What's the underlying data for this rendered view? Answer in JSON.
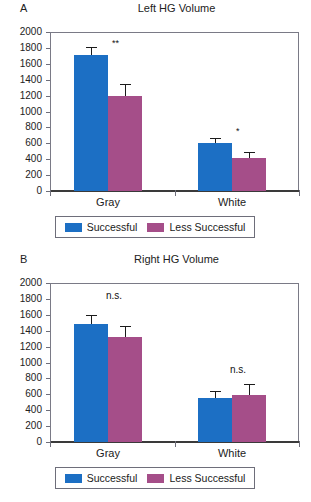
{
  "figure": {
    "panels": [
      {
        "letter": "A",
        "title": "Left HG Volume",
        "categories": [
          "Gray",
          "White"
        ],
        "legend": [
          {
            "label": "Successful",
            "color": "#1c6fc4"
          },
          {
            "label": "Less Successful",
            "color": "#a54e89"
          }
        ],
        "yticks": [
          "2000",
          "1800",
          "1600",
          "1400",
          "1200",
          "1000",
          "800",
          "600",
          "400",
          "200",
          "0"
        ],
        "annotations": [
          "**",
          "*"
        ]
      },
      {
        "letter": "B",
        "title": "Right HG Volume",
        "categories": [
          "Gray",
          "White"
        ],
        "legend": [
          {
            "label": "Successful",
            "color": "#1c6fc4"
          },
          {
            "label": "Less Successful",
            "color": "#a54e89"
          }
        ],
        "yticks": [
          "2000",
          "1800",
          "1600",
          "1400",
          "1200",
          "1000",
          "800",
          "600",
          "400",
          "200",
          "0"
        ],
        "annotations": [
          "n.s.",
          "n.s."
        ]
      }
    ]
  },
  "chart_data": [
    {
      "type": "bar",
      "panel": "A",
      "title": "Left HG Volume",
      "xlabel": "",
      "ylabel": "",
      "ylim": [
        0,
        2000
      ],
      "ytick_values": [
        0,
        200,
        400,
        600,
        800,
        1000,
        1200,
        1400,
        1600,
        1800,
        2000
      ],
      "grid": false,
      "legend_position": "below",
      "categories": [
        "Gray",
        "White"
      ],
      "series": [
        {
          "name": "Successful",
          "color": "#1c6fc4",
          "values": [
            1710,
            605
          ],
          "errors": [
            90,
            50
          ]
        },
        {
          "name": "Less Successful",
          "color": "#a54e89",
          "values": [
            1190,
            415
          ],
          "errors": [
            140,
            60
          ]
        }
      ],
      "annotations": [
        {
          "category": "Gray",
          "text": "**",
          "y": 1800
        },
        {
          "category": "White",
          "text": "*",
          "y": 690
        }
      ]
    },
    {
      "type": "bar",
      "panel": "B",
      "title": "Right HG Volume",
      "xlabel": "",
      "ylabel": "",
      "ylim": [
        0,
        2000
      ],
      "ytick_values": [
        0,
        200,
        400,
        600,
        800,
        1000,
        1200,
        1400,
        1600,
        1800,
        2000
      ],
      "grid": false,
      "legend_position": "below",
      "categories": [
        "Gray",
        "White"
      ],
      "series": [
        {
          "name": "Successful",
          "color": "#1c6fc4",
          "values": [
            1480,
            550
          ],
          "errors": [
            110,
            75
          ]
        },
        {
          "name": "Less Successful",
          "color": "#a54e89",
          "values": [
            1320,
            595
          ],
          "errors": [
            130,
            120
          ]
        }
      ],
      "annotations": [
        {
          "category": "Gray",
          "text": "n.s.",
          "y": 1790
        },
        {
          "category": "White",
          "text": "n.s.",
          "y": 860
        }
      ]
    }
  ]
}
